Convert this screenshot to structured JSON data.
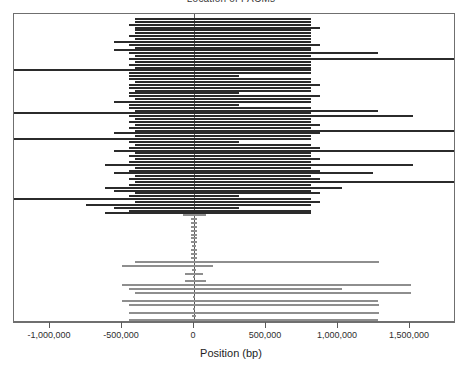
{
  "chart_data": {
    "type": "bar",
    "orientation": "horizontal",
    "title": "Location of PACMs",
    "xlabel": "Position (bp)",
    "ylabel": "",
    "xlim": [
      -1286000,
      1829000
    ],
    "ylim": [
      0,
      100
    ],
    "grid": false,
    "legend": false,
    "xticks": [
      -1000000,
      -500000,
      0,
      500000,
      1000000,
      1500000
    ],
    "xticklabels": [
      "-1,000,000",
      "-500,000",
      "0",
      "500,000",
      "1,000,000",
      "1,500,000"
    ],
    "reference_line_x": 0,
    "colors": {
      "dark_bar": "#2b2b2b",
      "grey_bar": "#8e8e8e",
      "axis": "#6f6f6f",
      "reference_line": "#5a5a5a",
      "background": "#ffffff"
    },
    "series": [
      {
        "name": "dark intervals",
        "color": "#2b2b2b",
        "thickness_px": 2,
        "intervals": [
          {
            "start": -410000,
            "end": 815000
          },
          {
            "start": -410000,
            "end": 815000
          },
          {
            "start": -452000,
            "end": 815000
          },
          {
            "start": -410000,
            "end": 878000
          },
          {
            "start": -410000,
            "end": 815000
          },
          {
            "start": -410000,
            "end": 815000
          },
          {
            "start": -452000,
            "end": 815000
          },
          {
            "start": -410000,
            "end": 815000
          },
          {
            "start": -557000,
            "end": 815000
          },
          {
            "start": -452000,
            "end": 878000
          },
          {
            "start": -410000,
            "end": 815000
          },
          {
            "start": -557000,
            "end": 815000
          },
          {
            "start": -452000,
            "end": 1280000
          },
          {
            "start": -410000,
            "end": 815000
          },
          {
            "start": -452000,
            "end": 1829000
          },
          {
            "start": -410000,
            "end": 815000
          },
          {
            "start": -452000,
            "end": 815000
          },
          {
            "start": -410000,
            "end": 815000
          },
          {
            "start": -1286000,
            "end": 815000
          },
          {
            "start": -452000,
            "end": 815000
          },
          {
            "start": -452000,
            "end": 312000
          },
          {
            "start": -452000,
            "end": 815000
          },
          {
            "start": -410000,
            "end": 815000
          },
          {
            "start": -452000,
            "end": 878000
          },
          {
            "start": -452000,
            "end": 815000
          },
          {
            "start": -410000,
            "end": 815000
          },
          {
            "start": -452000,
            "end": 312000
          },
          {
            "start": -452000,
            "end": 878000
          },
          {
            "start": -410000,
            "end": 815000
          },
          {
            "start": -557000,
            "end": 815000
          },
          {
            "start": -452000,
            "end": 312000
          },
          {
            "start": -452000,
            "end": 815000
          },
          {
            "start": -410000,
            "end": 1280000
          },
          {
            "start": -1286000,
            "end": 815000
          },
          {
            "start": -452000,
            "end": 1520000
          },
          {
            "start": -410000,
            "end": 815000
          },
          {
            "start": -452000,
            "end": 815000
          },
          {
            "start": -410000,
            "end": 878000
          },
          {
            "start": -452000,
            "end": 815000
          },
          {
            "start": -410000,
            "end": 1829000
          },
          {
            "start": -557000,
            "end": 878000
          },
          {
            "start": -410000,
            "end": 815000
          },
          {
            "start": -1286000,
            "end": 815000
          },
          {
            "start": -452000,
            "end": 312000
          },
          {
            "start": -410000,
            "end": 815000
          },
          {
            "start": -452000,
            "end": 878000
          },
          {
            "start": -557000,
            "end": 1829000
          },
          {
            "start": -410000,
            "end": 815000
          },
          {
            "start": -452000,
            "end": 815000
          },
          {
            "start": -410000,
            "end": 878000
          },
          {
            "start": -452000,
            "end": 815000
          },
          {
            "start": -620000,
            "end": 1520000
          },
          {
            "start": -410000,
            "end": 815000
          },
          {
            "start": -452000,
            "end": 878000
          },
          {
            "start": -557000,
            "end": 1240000
          },
          {
            "start": -410000,
            "end": 815000
          },
          {
            "start": -452000,
            "end": 878000
          },
          {
            "start": -410000,
            "end": 1829000
          },
          {
            "start": -452000,
            "end": 815000
          },
          {
            "start": -620000,
            "end": 1030000
          },
          {
            "start": -557000,
            "end": 815000
          },
          {
            "start": -410000,
            "end": 878000
          },
          {
            "start": -452000,
            "end": 312000
          },
          {
            "start": -1286000,
            "end": 815000
          },
          {
            "start": -410000,
            "end": 878000
          },
          {
            "start": -750000,
            "end": 815000
          },
          {
            "start": -557000,
            "end": 312000
          },
          {
            "start": -452000,
            "end": 815000
          },
          {
            "start": -620000,
            "end": 815000
          }
        ]
      },
      {
        "name": "grey intervals",
        "color": "#8e8e8e",
        "thickness_px": 2,
        "intervals": [
          {
            "start": -75000,
            "end": 80000
          },
          {
            "start": -20000,
            "end": 20000
          },
          {
            "start": -20000,
            "end": 20000
          },
          {
            "start": -20000,
            "end": 20000
          },
          {
            "start": -20000,
            "end": 20000
          },
          {
            "start": -20000,
            "end": 20000
          },
          {
            "start": -20000,
            "end": 20000
          },
          {
            "start": -20000,
            "end": 20000
          },
          {
            "start": -15000,
            "end": 15000
          },
          {
            "start": -20000,
            "end": 20000
          },
          {
            "start": -20000,
            "end": 20000
          },
          {
            "start": -20000,
            "end": 20000
          },
          {
            "start": -410000,
            "end": 1285000
          },
          {
            "start": -502000,
            "end": 130000
          },
          {
            "start": -15000,
            "end": 15000
          },
          {
            "start": -60000,
            "end": 60000
          },
          {
            "start": -10000,
            "end": 10000
          },
          {
            "start": -60000,
            "end": 80000
          },
          {
            "start": -502000,
            "end": 1510000
          },
          {
            "start": -452000,
            "end": 1030000
          },
          {
            "start": -410000,
            "end": 1510000
          },
          {
            "start": -10000,
            "end": 10000
          },
          {
            "start": -502000,
            "end": 1280000
          },
          {
            "start": -452000,
            "end": 1285000
          },
          {
            "start": -10000,
            "end": 10000
          },
          {
            "start": -452000,
            "end": 1285000
          },
          {
            "start": -15000,
            "end": 15000
          },
          {
            "start": -452000,
            "end": 1280000
          }
        ]
      }
    ]
  }
}
